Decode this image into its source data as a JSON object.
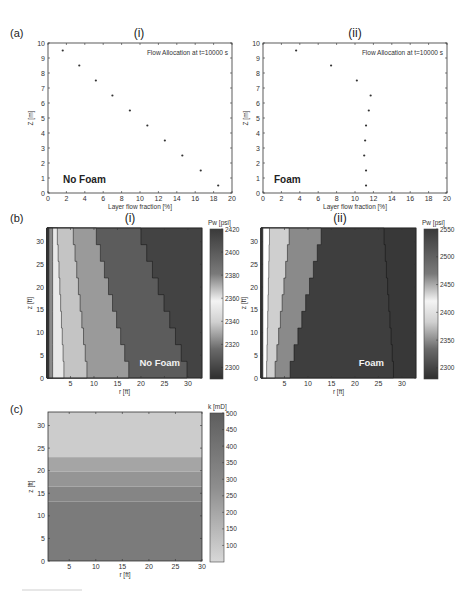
{
  "figure": {
    "panels": {
      "a": {
        "letter": "(a)"
      },
      "b": {
        "letter": "(b)"
      },
      "c": {
        "letter": "(c)"
      }
    }
  },
  "chart_data": [
    {
      "id": "a-i",
      "type": "scatter",
      "panel_label": "(i)",
      "title": "Flow Allocation at t=10000 s",
      "annotation": "No Foam",
      "xlabel": "Layer flow fraction [%]",
      "ylabel": "Z [m]",
      "xlim": [
        0,
        20
      ],
      "ylim": [
        0,
        10
      ],
      "xticks": [
        0,
        2,
        4,
        6,
        8,
        10,
        12,
        14,
        16,
        18,
        20
      ],
      "yticks": [
        0,
        1,
        2,
        3,
        4,
        5,
        6,
        7,
        8,
        9,
        10
      ],
      "grid": false,
      "points": [
        {
          "x": 1.6,
          "y": 9.5
        },
        {
          "x": 3.4,
          "y": 8.5
        },
        {
          "x": 5.2,
          "y": 7.5
        },
        {
          "x": 7.0,
          "y": 6.5
        },
        {
          "x": 8.9,
          "y": 5.5
        },
        {
          "x": 10.8,
          "y": 4.5
        },
        {
          "x": 12.7,
          "y": 3.5
        },
        {
          "x": 14.6,
          "y": 2.5
        },
        {
          "x": 16.6,
          "y": 1.5
        },
        {
          "x": 18.5,
          "y": 0.5
        }
      ]
    },
    {
      "id": "a-ii",
      "type": "scatter",
      "panel_label": "(ii)",
      "title": "Flow Allocation at t=10000 s",
      "annotation": "Foam",
      "xlabel": "Layer flow fraction [%]",
      "ylabel": "Z [m]",
      "xlim": [
        0,
        20
      ],
      "ylim": [
        0,
        10
      ],
      "xticks": [
        0,
        2,
        4,
        6,
        8,
        10,
        12,
        14,
        16,
        18,
        20
      ],
      "yticks": [
        0,
        1,
        2,
        3,
        4,
        5,
        6,
        7,
        8,
        9,
        10
      ],
      "grid": false,
      "points": [
        {
          "x": 3.6,
          "y": 9.5
        },
        {
          "x": 7.4,
          "y": 8.5
        },
        {
          "x": 10.2,
          "y": 7.5
        },
        {
          "x": 11.7,
          "y": 6.5
        },
        {
          "x": 11.5,
          "y": 5.5
        },
        {
          "x": 11.2,
          "y": 4.5
        },
        {
          "x": 11.1,
          "y": 3.5
        },
        {
          "x": 11.0,
          "y": 2.5
        },
        {
          "x": 11.2,
          "y": 1.5
        },
        {
          "x": 11.2,
          "y": 0.5
        }
      ]
    },
    {
      "id": "b-i",
      "type": "heatmap",
      "panel_label": "(i)",
      "annotation": "No Foam",
      "xlabel": "r [ft]",
      "ylabel": "z [ft]",
      "xlim": [
        0,
        33
      ],
      "ylim": [
        0,
        33
      ],
      "xticks": [
        5,
        10,
        15,
        20,
        25,
        30
      ],
      "yticks": [
        0,
        5,
        10,
        15,
        20,
        25,
        30
      ],
      "colorbar": {
        "label": "Pw [psi]",
        "ticks": [
          2420,
          2400,
          2380,
          2360,
          2340,
          2320,
          2300
        ],
        "range": [
          2290,
          2420
        ]
      },
      "bands": [
        {
          "shade": "#3c3c3c",
          "r_top": 0.4,
          "r_bottom": 0.4
        },
        {
          "shade": "#8a8a8a",
          "r_top": 1.2,
          "r_bottom": 1.2
        },
        {
          "shade": "#e8e8e8",
          "r_top": 2.2,
          "r_bottom": 3.6
        },
        {
          "shade": "#c4c4c4",
          "r_top": 5.6,
          "r_bottom": 8.5
        },
        {
          "shade": "#9a9a9a",
          "r_top": 10.5,
          "r_bottom": 17.4
        },
        {
          "shade": "#5c5c5c",
          "r_top": 20.0,
          "r_bottom": 29.8
        },
        {
          "shade": "#434343",
          "r_top": 33.0,
          "r_bottom": 33.0
        }
      ]
    },
    {
      "id": "b-ii",
      "type": "heatmap",
      "panel_label": "(ii)",
      "annotation": "Foam",
      "xlabel": "r [ft]",
      "ylabel": "z [ft]",
      "xlim": [
        0,
        33
      ],
      "ylim": [
        0,
        33
      ],
      "xticks": [
        5,
        10,
        15,
        20,
        25,
        30
      ],
      "yticks": [
        0,
        5,
        10,
        15,
        20,
        25,
        30
      ],
      "colorbar": {
        "label": "Pw [psi]",
        "ticks": [
          2550,
          2500,
          2450,
          2400,
          2350,
          2300
        ],
        "range": [
          2280,
          2550
        ]
      },
      "bands": [
        {
          "shade": "#3c3c3c",
          "r_top": 0.4,
          "r_bottom": 0.4
        },
        {
          "shade": "#ffffff",
          "r_top": 1.8,
          "r_bottom": 1.2
        },
        {
          "shade": "#cfcfcf",
          "r_top": 6.0,
          "r_bottom": 3.0
        },
        {
          "shade": "#8a8a8a",
          "r_top": 12.8,
          "r_bottom": 6.2
        },
        {
          "shade": "#3e3e3e",
          "r_top": 26.2,
          "r_bottom": 28.2
        },
        {
          "shade": "#383838",
          "r_top": 33.0,
          "r_bottom": 33.0
        }
      ]
    },
    {
      "id": "c",
      "type": "heatmap",
      "panel_label": "",
      "xlabel": "r [ft]",
      "ylabel": "z [ft]",
      "xlim": [
        1,
        30
      ],
      "ylim": [
        0,
        33
      ],
      "xticks": [
        5,
        10,
        15,
        20,
        25,
        30
      ],
      "yticks": [
        0,
        5,
        10,
        15,
        20,
        25,
        30
      ],
      "colorbar": {
        "label": "k [mD]",
        "ticks": [
          500,
          450,
          400,
          350,
          300,
          250,
          200,
          150,
          100
        ],
        "range": [
          50,
          500
        ]
      },
      "layers": [
        {
          "z_from": 23,
          "z_to": 33,
          "k": 100,
          "shade": "#cccccc"
        },
        {
          "z_from": 19.8,
          "z_to": 23,
          "k": 230,
          "shade": "#a5a5a5"
        },
        {
          "z_from": 16.5,
          "z_to": 19.8,
          "k": 290,
          "shade": "#959595"
        },
        {
          "z_from": 13.2,
          "z_to": 16.5,
          "k": 360,
          "shade": "#858585"
        },
        {
          "z_from": 0,
          "z_to": 13.2,
          "k": 420,
          "shade": "#7b7b7b"
        }
      ]
    }
  ]
}
